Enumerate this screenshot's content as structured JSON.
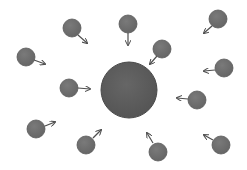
{
  "diagram": {
    "title": "",
    "width": 247,
    "height": 170,
    "background": "#ffffff",
    "colors": {
      "central_fill": "#5c5c5c",
      "central_stroke": "#4a4a4a",
      "particle_fill": "#707070",
      "particle_stroke": "#5a5a5a",
      "arrow": "#4e4e4e"
    },
    "central": {
      "cx": 129,
      "cy": 90,
      "r": 28
    },
    "particles": [
      {
        "cx": 72,
        "cy": 28,
        "r": 9,
        "arrow": [
          78,
          35,
          87,
          43
        ]
      },
      {
        "cx": 128,
        "cy": 24,
        "r": 9,
        "arrow": [
          128,
          33,
          128,
          45
        ]
      },
      {
        "cx": 162,
        "cy": 49,
        "r": 9,
        "arrow": [
          157,
          56,
          150,
          64
        ]
      },
      {
        "cx": 218,
        "cy": 19,
        "r": 9,
        "arrow": [
          212,
          26,
          204,
          33
        ]
      },
      {
        "cx": 26,
        "cy": 57,
        "r": 9,
        "arrow": [
          34,
          60,
          45,
          64
        ]
      },
      {
        "cx": 224,
        "cy": 68,
        "r": 9,
        "arrow": [
          215,
          70,
          204,
          71
        ]
      },
      {
        "cx": 69,
        "cy": 88,
        "r": 9,
        "arrow": [
          78,
          88,
          90,
          89
        ]
      },
      {
        "cx": 197,
        "cy": 100,
        "r": 9,
        "arrow": [
          188,
          99,
          177,
          98
        ]
      },
      {
        "cx": 36,
        "cy": 129,
        "r": 9,
        "arrow": [
          45,
          126,
          55,
          122
        ]
      },
      {
        "cx": 86,
        "cy": 145,
        "r": 9,
        "arrow": [
          93,
          138,
          101,
          130
        ]
      },
      {
        "cx": 158,
        "cy": 152,
        "r": 9,
        "arrow": [
          153,
          143,
          147,
          133
        ]
      },
      {
        "cx": 221,
        "cy": 145,
        "r": 9,
        "arrow": [
          213,
          140,
          204,
          135
        ]
      }
    ]
  }
}
